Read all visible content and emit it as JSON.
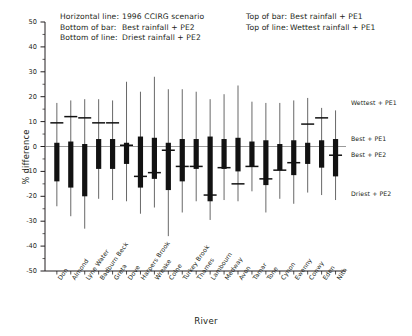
{
  "legend": {
    "left": [
      {
        "key": "Horizontal line:",
        "value": "1996 CCIRG scenario"
      },
      {
        "key": "Bottom of bar:",
        "value": "Best rainfall + PE2"
      },
      {
        "key": "Bottom of line:",
        "value": "Driest rainfall + PE2"
      }
    ],
    "right": [
      {
        "key": "Top of bar:",
        "value": "Best rainfall + PE1"
      },
      {
        "key": "Top of line:",
        "value": "Wettest rainfall + PE1"
      }
    ]
  },
  "annotations": [
    {
      "label": "Wettest + PE1",
      "value": 17.5
    },
    {
      "label": "Best + PE1",
      "value": 3.0
    },
    {
      "label": "Best + PE2",
      "value": -3.5
    },
    {
      "label": "Driest + PE2",
      "value": -19.0
    }
  ],
  "chart_data": {
    "type": "bar",
    "title": "",
    "subtitle": "",
    "xlabel": "River",
    "ylabel": "% difference",
    "ylim": [
      -50,
      50
    ],
    "ytick_step": 10,
    "yminor_step": 5,
    "grid": false,
    "legend_position": "top",
    "yticks": [
      50,
      40,
      30,
      20,
      10,
      0,
      -10,
      -20,
      -30,
      -40,
      -50
    ],
    "categories": [
      "Don",
      "Almond",
      "Lyne Water",
      "Badburn Beck",
      "Greta",
      "Dove",
      "Harpers Brook",
      "Wreake",
      "Colne",
      "Turkey Brook",
      "Thames",
      "Lambourn",
      "Medway",
      "Avon",
      "Tamar",
      "Tone",
      "Cynon",
      "Ewenny",
      "Conwy",
      "Eden",
      "Nith"
    ],
    "series": [
      {
        "name": "Wettest rainfall + PE1",
        "role": "line_top",
        "values": [
          17.5,
          18.5,
          19.0,
          19.0,
          18.5,
          26.0,
          22.0,
          28.0,
          23.0,
          23.0,
          22.0,
          19.0,
          21.0,
          24.5,
          18.0,
          17.5,
          17.5,
          18.5,
          19.5,
          15.5,
          14.5
        ]
      },
      {
        "name": "Best rainfall + PE1",
        "role": "bar_top",
        "values": [
          1.5,
          2.0,
          1.0,
          3.0,
          3.0,
          1.5,
          4.0,
          3.5,
          1.5,
          3.0,
          3.0,
          4.0,
          3.0,
          3.5,
          2.0,
          2.5,
          1.0,
          2.5,
          1.5,
          2.5,
          3.0
        ]
      },
      {
        "name": "Best rainfall + PE2",
        "role": "bar_bottom",
        "values": [
          -14.0,
          -16.5,
          -20.0,
          -9.0,
          -9.0,
          -7.0,
          -16.5,
          -13.0,
          -17.5,
          -14.0,
          -9.0,
          -22.0,
          -9.0,
          -10.0,
          -8.0,
          -15.5,
          -9.5,
          -11.5,
          -7.0,
          -8.5,
          -12.0
        ]
      },
      {
        "name": "Driest rainfall + PE2",
        "role": "line_bottom",
        "values": [
          -24.0,
          -28.0,
          -33.0,
          -21.0,
          -21.5,
          -22.0,
          -27.0,
          -24.5,
          -36.0,
          -26.5,
          -22.0,
          -29.5,
          -21.5,
          -22.0,
          -18.0,
          -26.5,
          -21.0,
          -23.0,
          -18.5,
          -19.5,
          -21.5
        ]
      },
      {
        "name": "1996 CCIRG scenario",
        "role": "tick_marker",
        "values": [
          9.5,
          12.0,
          11.5,
          9.5,
          9.5,
          0.5,
          -12.0,
          -10.5,
          -1.5,
          -8.0,
          -8.0,
          -19.5,
          -8.5,
          -15.0,
          -8.0,
          -13.0,
          -9.5,
          -6.5,
          9.0,
          11.5,
          -3.5
        ]
      }
    ]
  }
}
